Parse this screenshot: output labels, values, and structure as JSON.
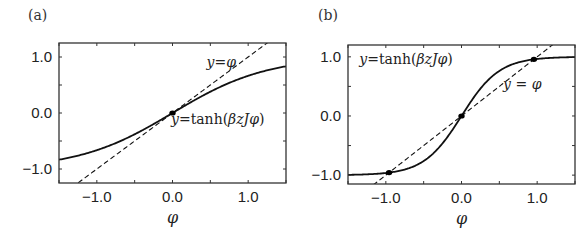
{
  "chart_data": [
    {
      "type": "line",
      "panel_label": "(a)",
      "xlabel": "φ",
      "ylabel": "",
      "xlim": [
        -1.5,
        1.5
      ],
      "ylim": [
        -1.25,
        1.25
      ],
      "xticks": [
        -1.0,
        0.0,
        1.0
      ],
      "xtick_labels": [
        "−1.0",
        "0.0",
        "1.0"
      ],
      "yticks": [
        -1.0,
        0.0,
        1.0
      ],
      "ytick_labels": [
        "−1.0",
        "0.0",
        "1.0"
      ],
      "minor_tick_step": 0.5,
      "grid": false,
      "series": [
        {
          "name": "y=tanh(βzJφ)",
          "style": "solid",
          "function": "tanh",
          "coef": 0.8
        },
        {
          "name": "y=φ",
          "style": "dashed",
          "function": "identity"
        }
      ],
      "points": [
        {
          "x": 0.0,
          "y": 0.0
        }
      ],
      "annotations": [
        {
          "text_prefix": "y",
          "text_eq": "=",
          "text_body": "φ",
          "x": 0.45,
          "y": 0.82
        },
        {
          "text_prefix": "y",
          "text_eq": "=tanh(",
          "text_body": "βzJφ",
          "text_suffix": ")",
          "x": -0.02,
          "y": -0.2
        }
      ]
    },
    {
      "type": "line",
      "panel_label": "(b)",
      "xlabel": "φ",
      "ylabel": "",
      "xlim": [
        -1.5,
        1.5
      ],
      "ylim": [
        -1.15,
        1.2
      ],
      "xticks": [
        -1.0,
        0.0,
        1.0
      ],
      "xtick_labels": [
        "−1.0",
        "0.0",
        "1.0"
      ],
      "yticks": [
        -1.0,
        0.0,
        1.0
      ],
      "ytick_labels": [
        "−1.0",
        "0.0",
        "1.0"
      ],
      "minor_tick_step": 0.5,
      "grid": false,
      "series": [
        {
          "name": "y=tanh(βzJφ)",
          "style": "solid",
          "function": "tanh",
          "coef": 2.0
        },
        {
          "name": "y=φ",
          "style": "dashed",
          "function": "identity"
        }
      ],
      "points": [
        {
          "x": -0.957,
          "y": -0.957
        },
        {
          "x": 0.0,
          "y": 0.0
        },
        {
          "x": 0.957,
          "y": 0.957
        }
      ],
      "annotations": [
        {
          "text_prefix": "y",
          "text_eq": "=tanh(",
          "text_body": "βzJφ",
          "text_suffix": ")",
          "x": -1.35,
          "y": 0.88
        },
        {
          "text_prefix": "y",
          "text_eq": " = ",
          "text_body": "φ",
          "x": 0.55,
          "y": 0.45
        }
      ]
    }
  ]
}
